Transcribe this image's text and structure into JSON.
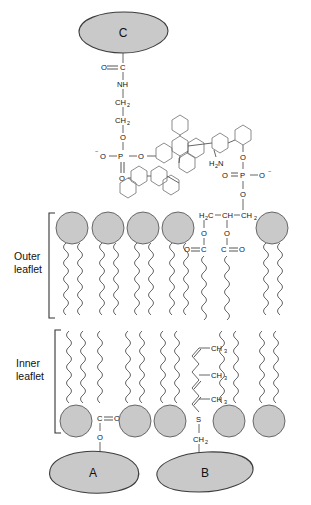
{
  "figure": {
    "background_color": "#ffffff",
    "headgroup_color": "#c9c9c9",
    "outline_color": "#5a5a5a"
  },
  "labels": {
    "outer_leaflet_line1": "Outer",
    "outer_leaflet_line2": "leaflet",
    "inner_leaflet_line1": "Inner",
    "inner_leaflet_line2": "leaflet",
    "protein_c": "C",
    "protein_a": "A",
    "protein_b": "B"
  },
  "gpi_anchor": {
    "carbonyl_o": "O",
    "carbonyl_c": "C",
    "amide": "NH",
    "ch2_a": "CH",
    "ch2_a_sub": "2",
    "ch2_b": "CH",
    "ch2_b_sub": "2",
    "ester_o": "O",
    "phosphate_o_minus": "O",
    "phosphate_p": "P",
    "phosphate_o_right": "O",
    "phosphate_o_double": "O",
    "amine": "H",
    "amine_sub": "2",
    "amine_n": "N",
    "ring_count": 10
  },
  "phospholipid": {
    "h2c": "H",
    "h2c_sub": "2",
    "h2c_c": "C",
    "ch": "CH",
    "ch2": "CH",
    "ch2_sub": "2",
    "o_left": "O",
    "o_right": "O",
    "carbonyl_left_o": "O",
    "carbonyl_left_c": "C",
    "carbonyl_right_c": "C",
    "carbonyl_right_o": "O",
    "phos_o_top": "O",
    "phos_p": "P",
    "phos_o_left": "O",
    "phos_o_right": "O",
    "phos_o_bottom": "O"
  },
  "acyl_anchor": {
    "carbonyl_c": "C",
    "carbonyl_o": "O",
    "ester_o": "O"
  },
  "prenyl_anchor": {
    "ch3_1": "CH",
    "ch3_1_sub": "3",
    "ch3_2": "CH",
    "ch3_2_sub": "3",
    "ch3_3": "CH",
    "ch3_3_sub": "3",
    "sulfur": "S",
    "ch2": "CH",
    "ch2_sub": "2"
  },
  "membrane": {
    "outer_leaflet_heads": 5,
    "inner_leaflet_heads": 5
  }
}
